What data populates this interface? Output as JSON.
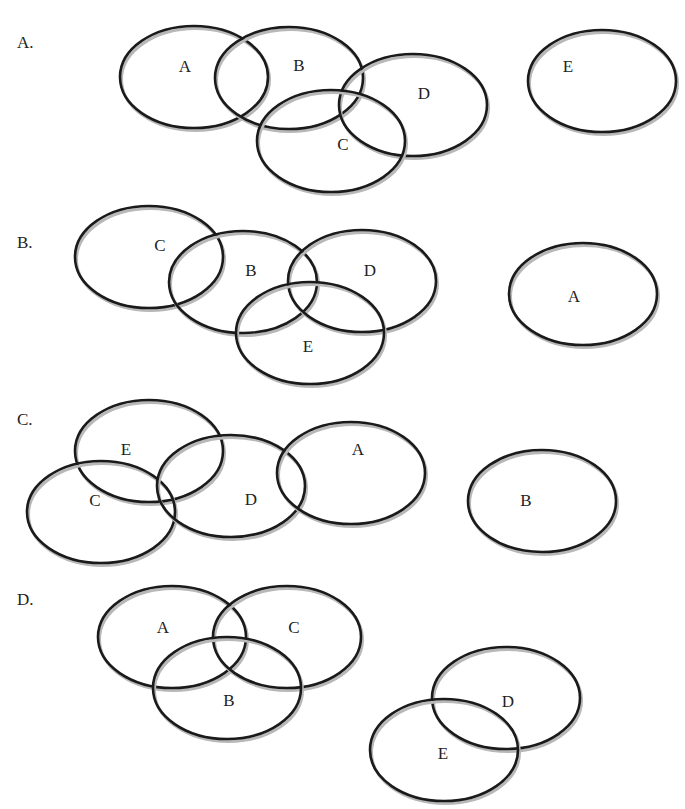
{
  "figure": {
    "colors": {
      "stroke": "#1a1a1a",
      "shadow": "#b8b8b8",
      "text": "#222222",
      "background": "#ffffff"
    },
    "ellipse_radii": {
      "rx": 74,
      "ry": 51
    }
  },
  "panels": [
    {
      "label": "A.",
      "label_pos": [
        17,
        48
      ],
      "sets": [
        {
          "name": "A",
          "cx": 194,
          "cy": 77,
          "label_pos": [
            185,
            66
          ]
        },
        {
          "name": "B",
          "cx": 289,
          "cy": 78,
          "label_pos": [
            299,
            65
          ]
        },
        {
          "name": "D",
          "cx": 413,
          "cy": 105,
          "label_pos": [
            424,
            93
          ]
        },
        {
          "name": "C",
          "cx": 331,
          "cy": 141,
          "label_pos": [
            343,
            144
          ]
        },
        {
          "name": "E",
          "cx": 602,
          "cy": 81,
          "label_pos": [
            568,
            66
          ]
        }
      ]
    },
    {
      "label": "B.",
      "label_pos": [
        17,
        248
      ],
      "sets": [
        {
          "name": "C",
          "cx": 149,
          "cy": 257,
          "label_pos": [
            160,
            245
          ]
        },
        {
          "name": "B",
          "cx": 243,
          "cy": 282,
          "label_pos": [
            251,
            270
          ]
        },
        {
          "name": "D",
          "cx": 362,
          "cy": 281,
          "label_pos": [
            370,
            270
          ]
        },
        {
          "name": "E",
          "cx": 310,
          "cy": 333,
          "label_pos": [
            308,
            346
          ]
        },
        {
          "name": "A",
          "cx": 583,
          "cy": 294,
          "label_pos": [
            574,
            296
          ]
        }
      ]
    },
    {
      "label": "C.",
      "label_pos": [
        17,
        425
      ],
      "sets": [
        {
          "name": "E",
          "cx": 149,
          "cy": 451,
          "label_pos": [
            126,
            449
          ]
        },
        {
          "name": "C",
          "cx": 101,
          "cy": 512,
          "label_pos": [
            95,
            500
          ]
        },
        {
          "name": "D",
          "cx": 231,
          "cy": 486,
          "label_pos": [
            251,
            499
          ]
        },
        {
          "name": "A",
          "cx": 351,
          "cy": 473,
          "label_pos": [
            358,
            449
          ]
        },
        {
          "name": "B",
          "cx": 542,
          "cy": 501,
          "label_pos": [
            526,
            500
          ]
        }
      ]
    },
    {
      "label": "D.",
      "label_pos": [
        17,
        605
      ],
      "sets": [
        {
          "name": "A",
          "cx": 172,
          "cy": 637,
          "label_pos": [
            163,
            627
          ]
        },
        {
          "name": "C",
          "cx": 287,
          "cy": 637,
          "label_pos": [
            294,
            627
          ]
        },
        {
          "name": "B",
          "cx": 227,
          "cy": 688,
          "label_pos": [
            229,
            700
          ]
        },
        {
          "name": "D",
          "cx": 506,
          "cy": 698,
          "label_pos": [
            508,
            701
          ]
        },
        {
          "name": "E",
          "cx": 444,
          "cy": 750,
          "label_pos": [
            443,
            753
          ]
        }
      ]
    }
  ]
}
